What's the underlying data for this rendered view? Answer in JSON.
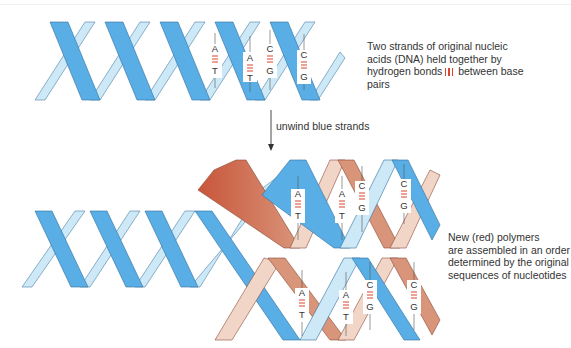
{
  "figure": {
    "colors": {
      "original_strand": "#5aaee6",
      "original_strand_back": "#cde8f7",
      "new_strand": "#d9957a",
      "new_strand_back": "#f1d6c8",
      "hydrogen_bond": "#d9452b",
      "text": "#333333"
    }
  },
  "annotations": {
    "top_caption_lines": [
      "Two strands of original nucleic",
      "acids  (DNA) held together by",
      "hydrogen bonds",
      "between base",
      "pairs"
    ],
    "arrow_label": "unwind blue strands",
    "bottom_caption_lines": [
      "New (red) polymers",
      "are assembled in an order",
      "determined by the original",
      "sequences of nucleotides"
    ]
  },
  "base_pairs": {
    "top_helix": [
      {
        "top": "A",
        "bottom": "T"
      },
      {
        "top": "A",
        "bottom": "T"
      },
      {
        "top": "C",
        "bottom": "G"
      },
      {
        "top": "C",
        "bottom": "G"
      }
    ],
    "upper_daughter": [
      {
        "top": "A",
        "bottom": "T"
      },
      {
        "top": "A",
        "bottom": "T"
      },
      {
        "top": "C",
        "bottom": "G"
      },
      {
        "top": "C",
        "bottom": "G"
      }
    ],
    "lower_daughter": [
      {
        "top": "A",
        "bottom": "T"
      },
      {
        "top": "A",
        "bottom": "T"
      },
      {
        "top": "C",
        "bottom": "G"
      },
      {
        "top": "C",
        "bottom": "G"
      }
    ]
  }
}
